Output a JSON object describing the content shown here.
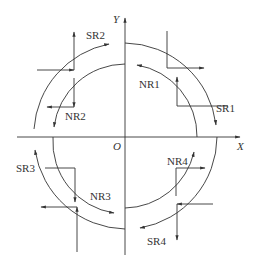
{
  "diagram": {
    "axes": {
      "x_label": "X",
      "y_label": "Y",
      "origin_label": "O"
    },
    "regions": [
      {
        "id": "SR1",
        "label": "SR1",
        "quadrant": 1,
        "circle": "outer"
      },
      {
        "id": "NR1",
        "label": "NR1",
        "quadrant": 1,
        "circle": "inner"
      },
      {
        "id": "SR2",
        "label": "SR2",
        "quadrant": 2,
        "circle": "outer"
      },
      {
        "id": "NR2",
        "label": "NR2",
        "quadrant": 2,
        "circle": "inner"
      },
      {
        "id": "SR3",
        "label": "SR3",
        "quadrant": 3,
        "circle": "outer"
      },
      {
        "id": "NR3",
        "label": "NR3",
        "quadrant": 3,
        "circle": "inner"
      },
      {
        "id": "SR4",
        "label": "SR4",
        "quadrant": 4,
        "circle": "outer"
      },
      {
        "id": "NR4",
        "label": "NR4",
        "quadrant": 4,
        "circle": "inner"
      }
    ],
    "stroke_color": "#333333"
  }
}
